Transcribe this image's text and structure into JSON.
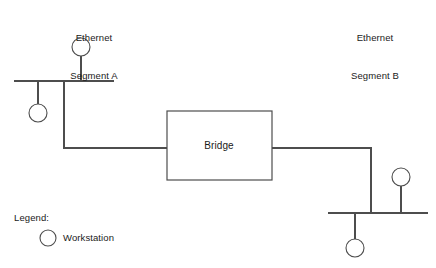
{
  "diagram": {
    "title_segment_a": "Ethernet\nSegment A",
    "title_segment_b": "Ethernet\nSegment B",
    "bridge_label": "Bridge",
    "line_color": "#4d4d4d",
    "background_color": "#ffffff",
    "text_color": "#1a1a1a"
  },
  "segment_a": {
    "caption_line1": "Ethernet",
    "caption_line2": "Segment A",
    "workstations": [
      {
        "name": "segment-a-workstation-top"
      },
      {
        "name": "segment-a-workstation-bottom"
      }
    ]
  },
  "segment_b": {
    "caption_line1": "Ethernet",
    "caption_line2": "Segment B",
    "workstations": [
      {
        "name": "segment-b-workstation-top"
      },
      {
        "name": "segment-b-workstation-bottom"
      }
    ]
  },
  "bridge": {
    "label": "Bridge"
  },
  "legend": {
    "title": "Legend:",
    "entries": [
      {
        "symbol": "circle",
        "label": "Workstation"
      }
    ]
  }
}
